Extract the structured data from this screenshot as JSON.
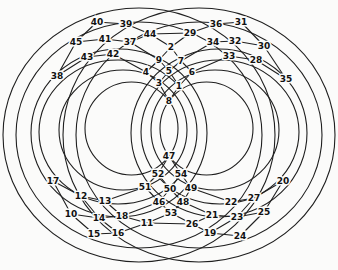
{
  "figure": {
    "type": "graph-diagram",
    "canvas": {
      "width": 338,
      "height": 270
    },
    "colors": {
      "background": "#fbfbfa",
      "line": "#1f1f1f",
      "label": "#111111",
      "label_halo": "#fbfbfa"
    },
    "label_font_px": 9,
    "ellipses": [
      {
        "cx": 131.5,
        "cy": 128.5,
        "rx": 46.5,
        "ry": 46.5
      },
      {
        "cx": 123,
        "cy": 130,
        "rx": 64,
        "ry": 60
      },
      {
        "cx": 118,
        "cy": 132,
        "rx": 79,
        "ry": 72
      },
      {
        "cx": 119,
        "cy": 133,
        "rx": 88,
        "ry": 84
      },
      {
        "cx": 139,
        "cy": 135,
        "rx": 123,
        "ry": 113
      },
      {
        "cx": 139,
        "cy": 135,
        "rx": 136,
        "ry": 127
      },
      {
        "cx": 206.5,
        "cy": 128.5,
        "rx": 46.5,
        "ry": 46.5
      },
      {
        "cx": 215,
        "cy": 130,
        "rx": 64,
        "ry": 60
      },
      {
        "cx": 220,
        "cy": 132,
        "rx": 79,
        "ry": 72
      },
      {
        "cx": 219,
        "cy": 133,
        "rx": 88,
        "ry": 84
      },
      {
        "cx": 199,
        "cy": 135,
        "rx": 123,
        "ry": 113
      },
      {
        "cx": 199,
        "cy": 135,
        "rx": 136,
        "ry": 127
      }
    ],
    "nodes": [
      {
        "id": 1,
        "label": "1",
        "x": 179,
        "y": 86
      },
      {
        "id": 2,
        "label": "2",
        "x": 171,
        "y": 47
      },
      {
        "id": 3,
        "label": "3",
        "x": 159,
        "y": 83
      },
      {
        "id": 4,
        "label": "4",
        "x": 146,
        "y": 72
      },
      {
        "id": 5,
        "label": "5",
        "x": 169,
        "y": 71
      },
      {
        "id": 6,
        "label": "6",
        "x": 192,
        "y": 72
      },
      {
        "id": 7,
        "label": "7",
        "x": 181,
        "y": 61
      },
      {
        "id": 8,
        "label": "8",
        "x": 169,
        "y": 101
      },
      {
        "id": 9,
        "label": "9",
        "x": 159,
        "y": 60
      },
      {
        "id": 10,
        "label": "10",
        "x": 71,
        "y": 214
      },
      {
        "id": 11,
        "label": "11",
        "x": 147,
        "y": 223
      },
      {
        "id": 12,
        "label": "12",
        "x": 81,
        "y": 196
      },
      {
        "id": 13,
        "label": "13",
        "x": 105,
        "y": 201
      },
      {
        "id": 14,
        "label": "14",
        "x": 99,
        "y": 218
      },
      {
        "id": 15,
        "label": "15",
        "x": 94,
        "y": 234
      },
      {
        "id": 16,
        "label": "16",
        "x": 118,
        "y": 233
      },
      {
        "id": 17,
        "label": "17",
        "x": 53,
        "y": 181
      },
      {
        "id": 18,
        "label": "18",
        "x": 122,
        "y": 216
      },
      {
        "id": 19,
        "label": "19",
        "x": 210,
        "y": 233
      },
      {
        "id": 20,
        "label": "20",
        "x": 283,
        "y": 181
      },
      {
        "id": 21,
        "label": "21",
        "x": 212,
        "y": 215
      },
      {
        "id": 22,
        "label": "22",
        "x": 231,
        "y": 202
      },
      {
        "id": 23,
        "label": "23",
        "x": 237,
        "y": 217
      },
      {
        "id": 24,
        "label": "24",
        "x": 240,
        "y": 236
      },
      {
        "id": 25,
        "label": "25",
        "x": 264,
        "y": 212
      },
      {
        "id": 26,
        "label": "26",
        "x": 192,
        "y": 224
      },
      {
        "id": 27,
        "label": "27",
        "x": 254,
        "y": 198
      },
      {
        "id": 28,
        "label": "28",
        "x": 256,
        "y": 60
      },
      {
        "id": 29,
        "label": "29",
        "x": 190,
        "y": 33
      },
      {
        "id": 30,
        "label": "30",
        "x": 264,
        "y": 46
      },
      {
        "id": 31,
        "label": "31",
        "x": 241,
        "y": 22
      },
      {
        "id": 32,
        "label": "32",
        "x": 235,
        "y": 41
      },
      {
        "id": 33,
        "label": "33",
        "x": 229,
        "y": 56
      },
      {
        "id": 34,
        "label": "34",
        "x": 213,
        "y": 42
      },
      {
        "id": 35,
        "label": "35",
        "x": 286,
        "y": 79
      },
      {
        "id": 36,
        "label": "36",
        "x": 216,
        "y": 24
      },
      {
        "id": 37,
        "label": "37",
        "x": 130,
        "y": 42
      },
      {
        "id": 38,
        "label": "38",
        "x": 57,
        "y": 76
      },
      {
        "id": 39,
        "label": "39",
        "x": 126,
        "y": 24
      },
      {
        "id": 40,
        "label": "40",
        "x": 97,
        "y": 22
      },
      {
        "id": 41,
        "label": "41",
        "x": 105,
        "y": 39
      },
      {
        "id": 42,
        "label": "42",
        "x": 113,
        "y": 54
      },
      {
        "id": 43,
        "label": "43",
        "x": 87,
        "y": 57
      },
      {
        "id": 44,
        "label": "44",
        "x": 150,
        "y": 34
      },
      {
        "id": 45,
        "label": "45",
        "x": 76,
        "y": 42
      },
      {
        "id": 46,
        "label": "46",
        "x": 159,
        "y": 202
      },
      {
        "id": 47,
        "label": "47",
        "x": 169,
        "y": 156
      },
      {
        "id": 48,
        "label": "48",
        "x": 183,
        "y": 202
      },
      {
        "id": 49,
        "label": "49",
        "x": 191,
        "y": 188
      },
      {
        "id": 50,
        "label": "50",
        "x": 170,
        "y": 189
      },
      {
        "id": 51,
        "label": "51",
        "x": 145,
        "y": 187
      },
      {
        "id": 52,
        "label": "52",
        "x": 158,
        "y": 174
      },
      {
        "id": 53,
        "label": "53",
        "x": 171,
        "y": 213
      },
      {
        "id": 54,
        "label": "54",
        "x": 181,
        "y": 174
      }
    ],
    "edges": [
      [
        2,
        9
      ],
      [
        2,
        7
      ],
      [
        9,
        5
      ],
      [
        7,
        5
      ],
      [
        9,
        4
      ],
      [
        7,
        6
      ],
      [
        4,
        3
      ],
      [
        5,
        3
      ],
      [
        5,
        1
      ],
      [
        6,
        1
      ],
      [
        3,
        8
      ],
      [
        1,
        8
      ],
      [
        44,
        2
      ],
      [
        29,
        2
      ],
      [
        37,
        9
      ],
      [
        34,
        7
      ],
      [
        42,
        4
      ],
      [
        33,
        6
      ],
      [
        40,
        39
      ],
      [
        39,
        44
      ],
      [
        37,
        44
      ],
      [
        44,
        29
      ],
      [
        45,
        41
      ],
      [
        41,
        37
      ],
      [
        43,
        42
      ],
      [
        38,
        45
      ],
      [
        38,
        43
      ],
      [
        40,
        45
      ],
      [
        36,
        31
      ],
      [
        29,
        36
      ],
      [
        34,
        32
      ],
      [
        32,
        30
      ],
      [
        33,
        28
      ],
      [
        30,
        35
      ],
      [
        28,
        35
      ],
      [
        31,
        30
      ],
      [
        47,
        52
      ],
      [
        47,
        54
      ],
      [
        52,
        50
      ],
      [
        54,
        50
      ],
      [
        52,
        51
      ],
      [
        54,
        49
      ],
      [
        51,
        46
      ],
      [
        50,
        46
      ],
      [
        50,
        48
      ],
      [
        49,
        48
      ],
      [
        46,
        53
      ],
      [
        48,
        53
      ],
      [
        53,
        11
      ],
      [
        53,
        26
      ],
      [
        51,
        13
      ],
      [
        49,
        22
      ],
      [
        46,
        18
      ],
      [
        48,
        21
      ],
      [
        17,
        12
      ],
      [
        17,
        10
      ],
      [
        12,
        13
      ],
      [
        12,
        14
      ],
      [
        13,
        18
      ],
      [
        10,
        14
      ],
      [
        10,
        15
      ],
      [
        14,
        16
      ],
      [
        14,
        18
      ],
      [
        15,
        16
      ],
      [
        16,
        11
      ],
      [
        18,
        11
      ],
      [
        20,
        27
      ],
      [
        20,
        25
      ],
      [
        27,
        22
      ],
      [
        27,
        23
      ],
      [
        25,
        23
      ],
      [
        25,
        24
      ],
      [
        23,
        19
      ],
      [
        23,
        21
      ],
      [
        24,
        19
      ],
      [
        19,
        26
      ],
      [
        21,
        26
      ],
      [
        11,
        26
      ]
    ]
  }
}
